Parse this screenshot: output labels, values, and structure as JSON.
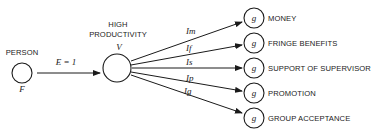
{
  "diagram": {
    "person": {
      "label": "PERSON",
      "sublabel": "F"
    },
    "effort_arrow": {
      "label": "E = 1"
    },
    "outcome": {
      "label_line1": "HIGH",
      "label_line2": "PRODUCTIVITY",
      "sublabel": "V"
    },
    "instrumentalities": [
      {
        "label": "Im",
        "goal_symbol": "g",
        "goal_label": "MONEY"
      },
      {
        "label": "If",
        "goal_symbol": "g",
        "goal_label": "FRINGE BENEFITS"
      },
      {
        "label": "Is",
        "goal_symbol": "g",
        "goal_label": "SUPPORT OF SUPERVISOR"
      },
      {
        "label": "Ip",
        "goal_symbol": "g",
        "goal_label": "PROMOTION"
      },
      {
        "label": "Ig",
        "goal_symbol": "g",
        "goal_label": "GROUP ACCEPTANCE"
      }
    ]
  }
}
